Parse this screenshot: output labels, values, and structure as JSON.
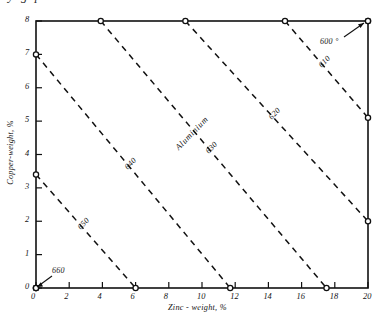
{
  "page": {
    "cut_off_header": "y  g  p"
  },
  "chart_data": {
    "type": "line",
    "title": "",
    "xlabel": "Zinc - weight, %",
    "ylabel": "Copper-weight, %",
    "xlim": [
      0,
      20
    ],
    "ylim": [
      0,
      8
    ],
    "xticks": [
      "0",
      "2",
      "4",
      "6",
      "8",
      "10",
      "12",
      "14",
      "16",
      "18",
      "20"
    ],
    "yticks": [
      "0",
      "1",
      "2",
      "3",
      "4",
      "5",
      "6",
      "7",
      "8"
    ],
    "grid": false,
    "legend": "none",
    "annotations": [
      {
        "text": "Aluminium",
        "x": 9.5,
        "y": 4.6,
        "rotation": -46
      }
    ],
    "series": [
      {
        "name": "600",
        "label": "600 °",
        "x": [
          20,
          20
        ],
        "y": [
          8,
          8
        ]
      },
      {
        "name": "610",
        "label": "610",
        "x": [
          15.0,
          20.0
        ],
        "y": [
          8.0,
          5.1
        ]
      },
      {
        "name": "620",
        "label": "620",
        "x": [
          9.0,
          20.0
        ],
        "y": [
          8.0,
          2.0
        ]
      },
      {
        "name": "630",
        "label": "630",
        "x": [
          3.9,
          17.5
        ],
        "y": [
          8.0,
          0.0
        ]
      },
      {
        "name": "640",
        "label": "640",
        "x": [
          0.0,
          11.7
        ],
        "y": [
          7.0,
          0.0
        ]
      },
      {
        "name": "650",
        "label": "650",
        "x": [
          0.0,
          6.0
        ],
        "y": [
          3.4,
          0.0
        ]
      },
      {
        "name": "660",
        "label": "660",
        "x": [
          0.0,
          0.0
        ],
        "y": [
          0.0,
          0.0
        ]
      }
    ]
  }
}
